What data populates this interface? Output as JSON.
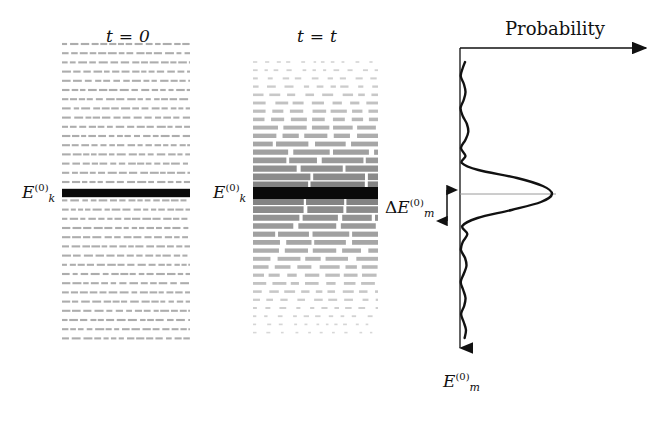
{
  "figure": {
    "width": 669,
    "height": 422,
    "background": "#ffffff",
    "ink_color": "#111111",
    "faint_color": "#8d8d8d"
  },
  "panels": {
    "left": {
      "title": "t = 0",
      "title_x": 106,
      "title_y": 26,
      "level_label": "E",
      "level_sub": "k",
      "level_sup": "(0)",
      "label_x": 22,
      "label_y": 182,
      "x_start": 62,
      "x_end": 190,
      "y_top": 44,
      "y_bottom": 334,
      "row_spacing": 9.2,
      "highlight_y": 193,
      "dash_color": "#8d8d8d",
      "highlight_color": "#0a0a0a"
    },
    "middle": {
      "title": "t = t",
      "title_x": 297,
      "title_y": 26,
      "level_label": "E",
      "level_sub": "k",
      "level_sup": "(0)",
      "label_x": 213,
      "label_y": 182,
      "x_start": 253,
      "x_end": 378,
      "y_top": 62,
      "y_bottom": 338,
      "row_spacing": 8.2,
      "highlight_y": 193,
      "dash_color": "#8d8d8d",
      "highlight_color": "#0a0a0a"
    },
    "right": {
      "axis_title": "Probability",
      "axis_title_x": 505,
      "axis_title_y": 18,
      "energy_axis_label": "E",
      "energy_axis_sub": "m",
      "energy_axis_sup": "(0)",
      "energy_axis_label_x": 443,
      "energy_axis_label_y": 371,
      "width_label_delta": "Δ",
      "width_label": "E",
      "width_label_sub": "m",
      "width_label_sup": "(0)",
      "width_label_x": 385,
      "width_label_y": 197,
      "origin_x": 460,
      "origin_y": 48,
      "h_arrow_end_x": 655,
      "v_arrow_end_y": 358,
      "guide_line_y": 194,
      "guide_line_x_end": 556,
      "bracket_top_y": 185,
      "bracket_bottom_y": 226
    }
  },
  "chart_data": {
    "type": "line",
    "xlabel": "Probability",
    "ylabel": "E_m^(0)",
    "orientation": "horizontal-probability-vertical-energy",
    "center_energy_y": 194,
    "peak_probability_x": 552,
    "baseline_x": 460,
    "main_lobe_half_width_px": 31,
    "notes": [
      "central maximum reaches probability peak at x=552",
      "first zeros of the central lobe at y=163 and y=226",
      "secondary side lobes decay in amplitude away from the center",
      "full width marked by the double arrow is labelled Delta E_m^(0)"
    ],
    "curve_points": [
      {
        "y": 62,
        "p": 0.055
      },
      {
        "y": 68,
        "p": 0.03
      },
      {
        "y": 76,
        "p": 0.008
      },
      {
        "y": 84,
        "p": 0.042
      },
      {
        "y": 92,
        "p": 0.06
      },
      {
        "y": 100,
        "p": 0.04
      },
      {
        "y": 108,
        "p": 0.006
      },
      {
        "y": 116,
        "p": 0.03
      },
      {
        "y": 124,
        "p": 0.075
      },
      {
        "y": 132,
        "p": 0.09
      },
      {
        "y": 140,
        "p": 0.058
      },
      {
        "y": 148,
        "p": 0.01
      },
      {
        "y": 156,
        "p": 0.06
      },
      {
        "y": 163,
        "p": 0.02
      },
      {
        "y": 170,
        "p": 0.2
      },
      {
        "y": 178,
        "p": 0.62
      },
      {
        "y": 186,
        "p": 0.9
      },
      {
        "y": 194,
        "p": 1.0
      },
      {
        "y": 202,
        "p": 0.88
      },
      {
        "y": 210,
        "p": 0.56
      },
      {
        "y": 218,
        "p": 0.19
      },
      {
        "y": 226,
        "p": 0.025
      },
      {
        "y": 234,
        "p": 0.08
      },
      {
        "y": 242,
        "p": 0.03
      },
      {
        "y": 250,
        "p": 0.01
      },
      {
        "y": 258,
        "p": 0.055
      },
      {
        "y": 266,
        "p": 0.07
      },
      {
        "y": 274,
        "p": 0.04
      },
      {
        "y": 282,
        "p": 0.008
      },
      {
        "y": 290,
        "p": 0.035
      },
      {
        "y": 298,
        "p": 0.06
      },
      {
        "y": 306,
        "p": 0.045
      },
      {
        "y": 314,
        "p": 0.012
      },
      {
        "y": 322,
        "p": 0.04
      },
      {
        "y": 330,
        "p": 0.065
      },
      {
        "y": 338,
        "p": 0.05
      }
    ]
  },
  "level_rows": {
    "left_description": "uniformly spaced faint dashed energy levels with one solid black level at E_k^(0)",
    "middle_description": "same ladder of levels whose linewidths broaden and darken symmetrically toward E_k^(0), thinning to sparse faint dashes at both extremes"
  }
}
